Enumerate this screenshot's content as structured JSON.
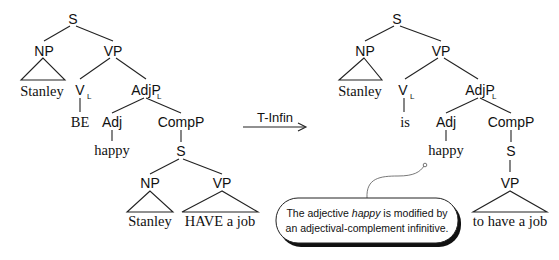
{
  "diagram": {
    "type": "syntax-tree-transformation",
    "transformation": {
      "label": "T-Infin",
      "arrow": "right"
    },
    "left_tree": {
      "root": "S",
      "nodes": {
        "s": "S",
        "np": "NP",
        "vp": "VP",
        "np_word": "Stanley",
        "v": "V",
        "v_sub": "L",
        "adjp": "AdjP",
        "adjp_sub": "L",
        "v_word": "BE",
        "adj": "Adj",
        "compp": "CompP",
        "adj_word": "happy",
        "s2": "S",
        "np2": "NP",
        "vp2": "VP",
        "np2_word": "Stanley",
        "vp2_word": "HAVE a job"
      }
    },
    "right_tree": {
      "root": "S",
      "nodes": {
        "s": "S",
        "np": "NP",
        "vp": "VP",
        "np_word": "Stanley",
        "v": "V",
        "v_sub": "L",
        "adjp": "AdjP",
        "adjp_sub": "L",
        "v_word": "is",
        "adj": "Adj",
        "compp": "CompP",
        "adj_word": "happy",
        "s2": "S",
        "vp2": "VP",
        "vp2_word": "to have a job"
      }
    },
    "callout": {
      "line1_pre": "The adjective ",
      "line1_em": "happy",
      "line1_post": " is modified by",
      "line2": "an adjectival-complement infinitive."
    }
  }
}
